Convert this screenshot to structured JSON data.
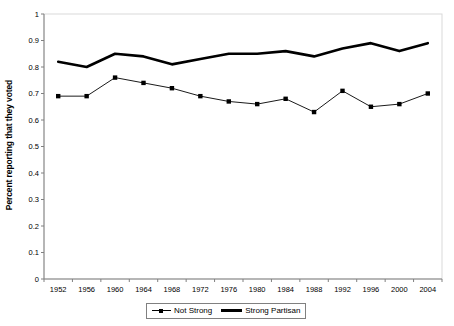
{
  "chart_data": {
    "type": "line",
    "title": "",
    "xlabel": "",
    "ylabel": "Percent reporting that they voted",
    "x": [
      1952,
      1956,
      1960,
      1964,
      1968,
      1972,
      1976,
      1980,
      1984,
      1988,
      1992,
      1996,
      2000,
      2004
    ],
    "categories": [
      "1952",
      "1956",
      "1960",
      "1964",
      "1968",
      "1972",
      "1976",
      "1980",
      "1984",
      "1988",
      "1992",
      "1996",
      "2000",
      "2004"
    ],
    "ylim": [
      0,
      1
    ],
    "ytick_labels": [
      "0",
      "0.1",
      "0.2",
      "0.3",
      "0.4",
      "0.5",
      "0.6",
      "0.7",
      "0.8",
      "0.9",
      "1"
    ],
    "ytick_values": [
      0,
      0.1,
      0.2,
      0.3,
      0.4,
      0.5,
      0.6,
      0.7,
      0.8,
      0.9,
      1
    ],
    "grid": false,
    "legend_position": "bottom",
    "series": [
      {
        "name": "Not Strong",
        "style": "thin-with-square-markers",
        "color": "#000000",
        "values": [
          0.69,
          0.69,
          0.76,
          0.74,
          0.72,
          0.69,
          0.67,
          0.66,
          0.68,
          0.63,
          0.71,
          0.65,
          0.66,
          0.7
        ]
      },
      {
        "name": "Strong Partisan",
        "style": "thick-line",
        "color": "#000000",
        "values": [
          0.82,
          0.8,
          0.85,
          0.84,
          0.81,
          0.83,
          0.85,
          0.85,
          0.86,
          0.84,
          0.87,
          0.89,
          0.86,
          0.89
        ]
      }
    ]
  },
  "legend": {
    "entries": [
      {
        "label": "Not Strong"
      },
      {
        "label": "Strong Partisan"
      }
    ]
  },
  "colors": {
    "axis": "#808080",
    "plot_border": "#d9d9d9",
    "series": "#000000",
    "background": "#ffffff"
  }
}
